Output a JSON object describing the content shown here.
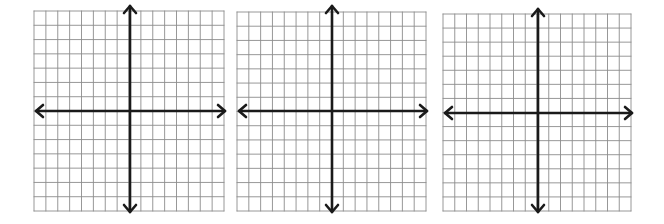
{
  "style": {
    "grid_color": "#8c8c8c",
    "axis_color": "#1a1a1a",
    "background": "#ffffff"
  },
  "planes": [
    {
      "id": "plane-1",
      "left": 34,
      "top": 11,
      "width": 190,
      "height": 200,
      "columns": 16,
      "rows": 14,
      "axis_x": 130,
      "axis_y": 111,
      "arrow_top": 5,
      "arrow_bottom": 213,
      "arrow_left": 35,
      "arrow_right": 226
    },
    {
      "id": "plane-2",
      "left": 237,
      "top": 12,
      "width": 189,
      "height": 199,
      "columns": 16,
      "rows": 14,
      "axis_x": 332,
      "axis_y": 111,
      "arrow_top": 5,
      "arrow_bottom": 213,
      "arrow_left": 238,
      "arrow_right": 428
    },
    {
      "id": "plane-3",
      "left": 443,
      "top": 14,
      "width": 188,
      "height": 197,
      "columns": 16,
      "rows": 14,
      "axis_x": 538,
      "axis_y": 113,
      "arrow_top": 8,
      "arrow_bottom": 213,
      "arrow_left": 444,
      "arrow_right": 633
    }
  ]
}
